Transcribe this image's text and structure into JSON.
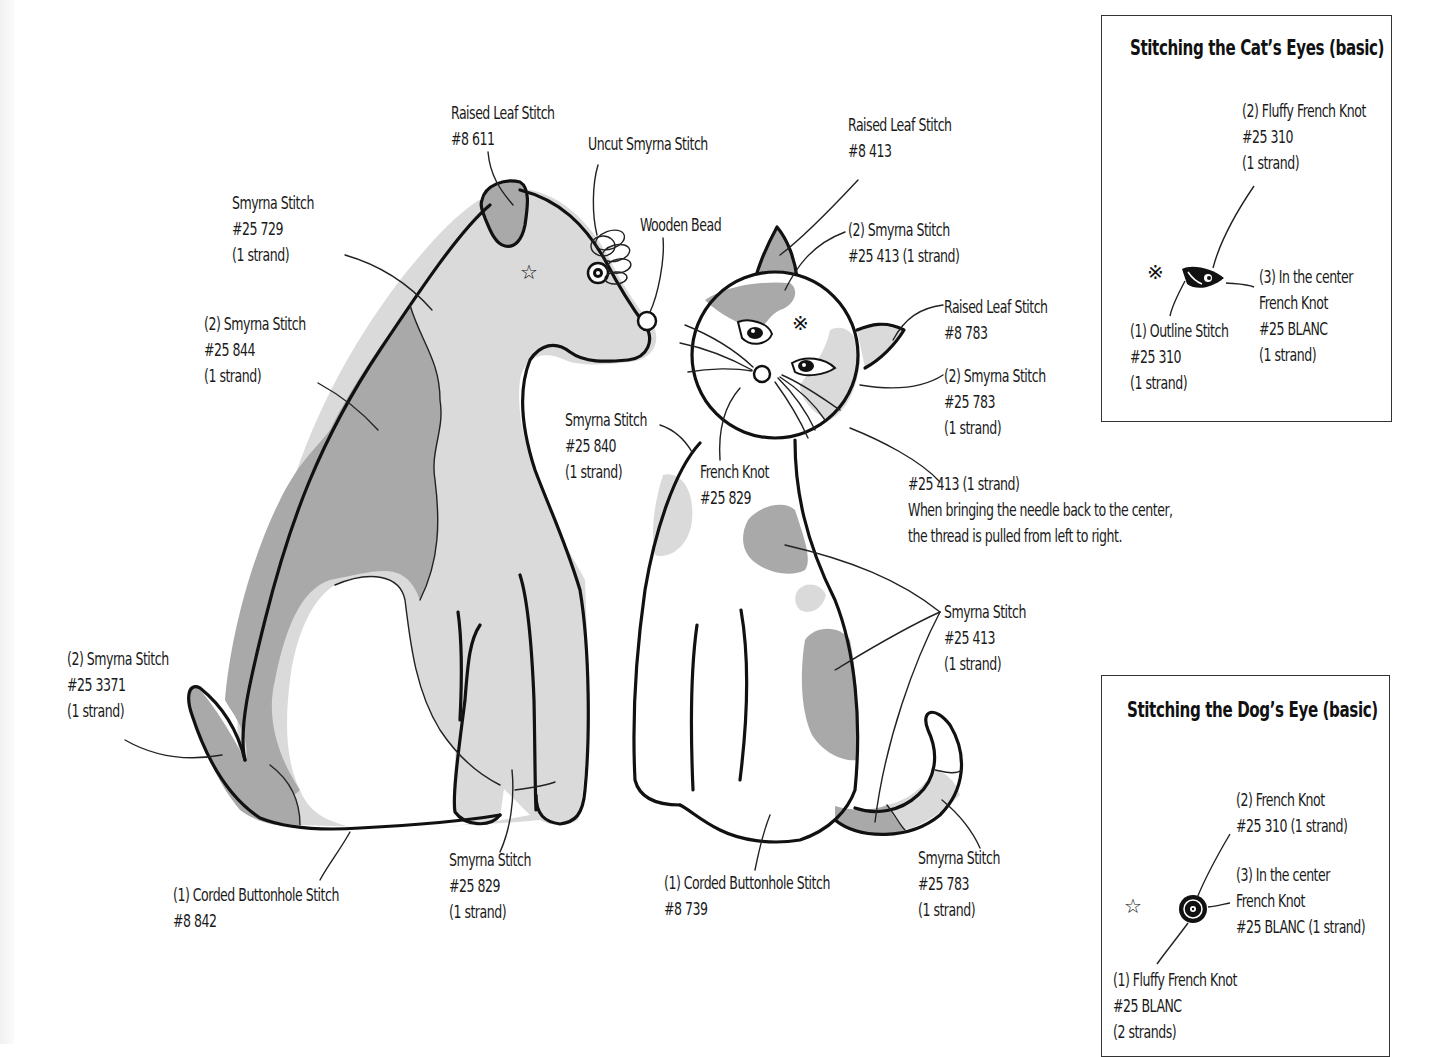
{
  "colors": {
    "outline": "#111111",
    "light_fill": "#dadada",
    "dark_fill": "#a9a9a9",
    "background": "#ffffff"
  },
  "dog_labels": [
    {
      "id": "ear",
      "lines": [
        "Raised Leaf Stitch",
        "#8 611"
      ]
    },
    {
      "id": "uncut",
      "lines": [
        "Uncut Smyrna Stitch"
      ]
    },
    {
      "id": "bead",
      "lines": [
        "Wooden Bead"
      ]
    },
    {
      "id": "body_light",
      "lines": [
        "Smyrna Stitch",
        "#25 729",
        "(1 strand)"
      ]
    },
    {
      "id": "body_dark",
      "lines": [
        "(2) Smyrna Stitch",
        "#25 844",
        "(1 strand)"
      ]
    },
    {
      "id": "tail",
      "lines": [
        "(2) Smyrna Stitch",
        "#25 3371",
        "(1 strand)"
      ]
    },
    {
      "id": "outline",
      "lines": [
        "(1) Corded Buttonhole Stitch",
        "#8 842"
      ]
    },
    {
      "id": "legs",
      "lines": [
        "Smyrna Stitch",
        "#25 829",
        "(1 strand)"
      ]
    }
  ],
  "cat_labels": [
    {
      "id": "ear_left",
      "lines": [
        "Raised Leaf Stitch",
        "#8 413"
      ]
    },
    {
      "id": "head_patch",
      "lines": [
        "(2) Smyrna Stitch",
        "#25 413 (1 strand)"
      ]
    },
    {
      "id": "ear_right",
      "lines": [
        "Raised Leaf Stitch",
        "#8 783"
      ]
    },
    {
      "id": "cheek",
      "lines": [
        "(2) Smyrna Stitch",
        "#25 783",
        "(1 strand)"
      ]
    },
    {
      "id": "chest_patch",
      "lines": [
        "Smyrna Stitch",
        "#25 840",
        "(1 strand)"
      ]
    },
    {
      "id": "nose",
      "lines": [
        "French Knot",
        "#25 829"
      ]
    },
    {
      "id": "whiskers",
      "lines": [
        "#25 413 (1 strand)",
        "When bringing the needle back to the center,",
        "the thread is pulled from left to right."
      ]
    },
    {
      "id": "body_patches",
      "lines": [
        "Smyrna Stitch",
        "#25 413",
        "(1 strand)"
      ]
    },
    {
      "id": "outline",
      "lines": [
        "(1) Corded Buttonhole Stitch",
        "#8 739"
      ]
    },
    {
      "id": "tail_tip",
      "lines": [
        "Smyrna Stitch",
        "#25 783",
        "(1 strand)"
      ]
    }
  ],
  "insets": {
    "cat_eyes": {
      "title": "Stitching the Cat’s Eyes (basic)",
      "labels": [
        {
          "id": "step2",
          "lines": [
            "(2) Fluffy French Knot",
            "#25 310",
            "(1 strand)"
          ]
        },
        {
          "id": "step3",
          "lines": [
            "(3) In the center",
            "French Knot",
            "#25 BLANC",
            "(1 strand)"
          ]
        },
        {
          "id": "step1",
          "lines": [
            "(1) Outline Stitch",
            "#25 310",
            "(1 strand)"
          ]
        }
      ],
      "marker_symbol": "※"
    },
    "dog_eye": {
      "title": "Stitching the Dog’s Eye (basic)",
      "labels": [
        {
          "id": "step2",
          "lines": [
            "(2) French Knot",
            "#25 310 (1 strand)"
          ]
        },
        {
          "id": "step3",
          "lines": [
            "(3) In the center",
            "French Knot",
            "#25 BLANC (1 strand)"
          ]
        },
        {
          "id": "step1",
          "lines": [
            "(1) Fluffy French Knot",
            "#25 BLANC",
            "(2 strands)"
          ]
        }
      ],
      "marker_symbol": "☆"
    }
  }
}
